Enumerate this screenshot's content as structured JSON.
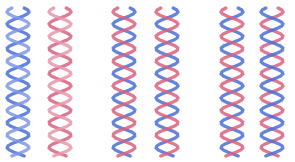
{
  "image": {
    "description": "Six ribbon helices arranged in three pairs",
    "helices": [
      {
        "id": "h1",
        "cx": 18,
        "strands": [
          "#4a6fd8",
          "#7f96e6"
        ],
        "label": "blue helix"
      },
      {
        "id": "h2",
        "cx": 60,
        "strands": [
          "#d9607e",
          "#e898ac"
        ],
        "label": "pink helix"
      },
      {
        "id": "h3",
        "cx": 124,
        "strands": [
          "#4a6fd8",
          "#d9607e"
        ],
        "label": "mixed helix"
      },
      {
        "id": "h4",
        "cx": 167,
        "strands": [
          "#4a6fd8",
          "#d9607e"
        ],
        "label": "mixed helix"
      },
      {
        "id": "h5",
        "cx": 232,
        "strands": [
          "#4a6fd8",
          "#d9607e"
        ],
        "label": "mixed helix"
      },
      {
        "id": "h6",
        "cx": 272,
        "strands": [
          "#d9607e",
          "#4a6fd8"
        ],
        "label": "mixed helix"
      }
    ]
  }
}
